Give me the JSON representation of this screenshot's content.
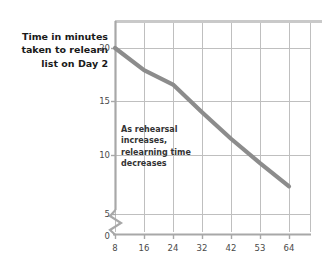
{
  "chart_data": {
    "type": "line",
    "title": "",
    "subtitle": "",
    "xlabel": "",
    "ylabel": "Time in minutes taken to relearn list on Day 2",
    "x": [
      8,
      16,
      24,
      32,
      42,
      53,
      64
    ],
    "categories": [
      "8",
      "16",
      "24",
      "32",
      "42",
      "53",
      "64"
    ],
    "values": [
      20,
      18,
      16.7,
      14.2,
      11.8,
      9.6,
      7.5
    ],
    "series": [
      {
        "name": "Relearning time",
        "values": [
          20,
          18,
          16.7,
          14.2,
          11.8,
          9.6,
          7.5
        ]
      }
    ],
    "xtick_labels": [
      "8",
      "16",
      "24",
      "32",
      "42",
      "53",
      "64"
    ],
    "ytick_labels": [
      "0",
      "5",
      "10",
      "15",
      "20"
    ],
    "ytick_values": [
      0,
      5,
      10,
      15,
      20
    ],
    "ylim": [
      0,
      22
    ],
    "grid": true,
    "legend": "none",
    "axis_break": true,
    "annotations": [
      {
        "name": "trend-note",
        "text": "As rehearsal increases, relearning time decreases"
      }
    ],
    "colors": {
      "line": "#8c8c8c",
      "grid": "#bfbfbf",
      "axis": "#9a9a9a",
      "text": "#1a1a1a",
      "tick_text": "#4a4a4a",
      "background": "#ffffff"
    }
  },
  "labels": {
    "y_axis_title": "Time in minutes taken to relearn list on Day 2",
    "y_axis_title_line1": "Time in minutes",
    "y_axis_title_line2": "taken to relearn",
    "y_axis_title_line3": "list on Day 2",
    "annotation_line1": "As rehearsal",
    "annotation_line2": "increases,",
    "annotation_line3": "relearning time",
    "annotation_line4": "decreases"
  },
  "ticks": {
    "x": [
      "8",
      "16",
      "24",
      "32",
      "42",
      "53",
      "64"
    ],
    "y": [
      "20",
      "15",
      "10",
      "5",
      "0"
    ]
  }
}
